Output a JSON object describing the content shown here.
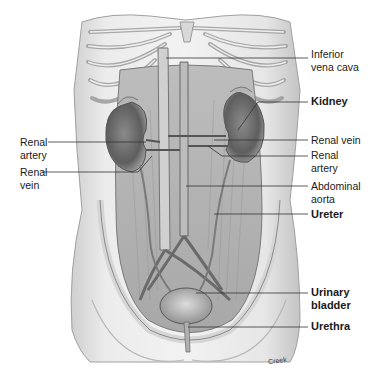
{
  "diagram": {
    "type": "anatomical-illustration",
    "colors": {
      "background": "#ffffff",
      "text": "#1a1a1a",
      "leader": "#333333",
      "tissue_light": "#e8e8e8",
      "tissue_mid": "#bdbdbd",
      "tissue_dark": "#6e6e6e"
    },
    "labels_right": [
      {
        "id": "inferior-vena-cava",
        "lines": [
          "Inferior",
          "vena cava"
        ],
        "bold": false
      },
      {
        "id": "kidney",
        "lines": [
          "Kidney"
        ],
        "bold": true
      },
      {
        "id": "renal-vein-right",
        "lines": [
          "Renal vein"
        ],
        "bold": false
      },
      {
        "id": "renal-artery-right",
        "lines": [
          "Renal",
          "artery"
        ],
        "bold": false
      },
      {
        "id": "abdominal-aorta",
        "lines": [
          "Abdominal",
          "aorta"
        ],
        "bold": false
      },
      {
        "id": "ureter",
        "lines": [
          "Ureter"
        ],
        "bold": true
      },
      {
        "id": "urinary-bladder",
        "lines": [
          "Urinary",
          "bladder"
        ],
        "bold": true
      },
      {
        "id": "urethra",
        "lines": [
          "Urethra"
        ],
        "bold": true
      }
    ],
    "labels_left": [
      {
        "id": "renal-artery-left",
        "lines": [
          "Renal",
          "artery"
        ],
        "bold": false
      },
      {
        "id": "renal-vein-left",
        "lines": [
          "Renal",
          "vein"
        ],
        "bold": false
      }
    ],
    "credit": "Creek"
  }
}
